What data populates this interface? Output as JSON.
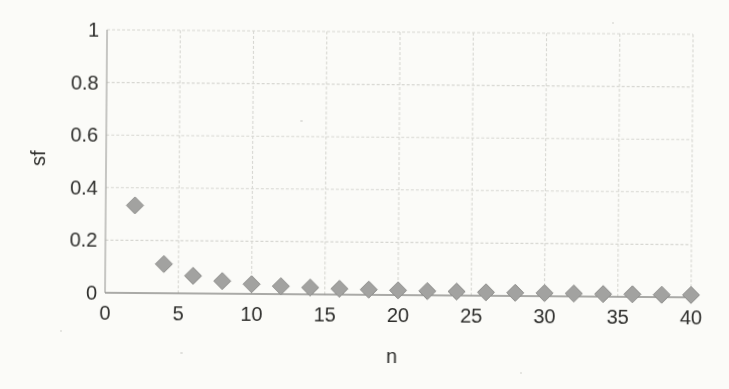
{
  "page": {
    "background": "#fbfbf8"
  },
  "chart_data": {
    "type": "scatter",
    "title": "",
    "xlabel": "n",
    "ylabel": "sf",
    "x": [
      2,
      4,
      6,
      8,
      10,
      12,
      14,
      16,
      18,
      20,
      22,
      24,
      26,
      28,
      30,
      32,
      34,
      36,
      38,
      40
    ],
    "y": [
      0.333,
      0.111,
      0.067,
      0.048,
      0.037,
      0.03,
      0.026,
      0.022,
      0.02,
      0.018,
      0.016,
      0.015,
      0.013,
      0.012,
      0.012,
      0.011,
      0.01,
      0.01,
      0.009,
      0.009
    ],
    "xlim": [
      0,
      40
    ],
    "ylim": [
      0,
      1
    ],
    "x_ticks": [
      0,
      5,
      10,
      15,
      20,
      25,
      30,
      35,
      40
    ],
    "x_tick_labels": [
      "0",
      "5",
      "10",
      "15",
      "20",
      "25",
      "30",
      "35",
      "40"
    ],
    "y_ticks": [
      0,
      0.2,
      0.4,
      0.6,
      0.8,
      1
    ],
    "y_tick_labels": [
      "0",
      "0.2",
      "0.4",
      "0.6",
      "0.8",
      "1"
    ],
    "grid": "on",
    "legend": "none",
    "marker": "diamond",
    "marker_size": 17,
    "marker_color": "#a2a2a0",
    "marker_edge_color": "#8c8c8a",
    "gridline_color": "#d7d7d2",
    "axis_line_color": "#a3a3a0",
    "bottom_axis_color": "#8f8f8c",
    "text_color": "#2e2e2c"
  }
}
